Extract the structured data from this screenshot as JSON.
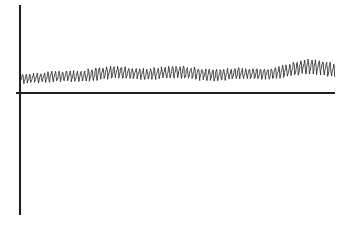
{
  "figure": {
    "background_color": "#ffffff",
    "axis_color": "#231f20",
    "signal_color": "#2b2b2f",
    "width": 352,
    "height": 225
  },
  "axes": {
    "y_axis": {
      "name": "y-axis",
      "x": 20,
      "y_top": 5,
      "y_bottom": 215
    },
    "x_axis": {
      "name": "x-axis",
      "y": 93,
      "x_left": 16,
      "x_right": 335
    }
  },
  "chart_data": {
    "type": "line",
    "title": "",
    "subtitle": "",
    "xlabel": "",
    "ylabel": "",
    "grid": false,
    "legend": null,
    "annotations": [],
    "xticks": [],
    "yticks": [],
    "xlim": [
      0,
      100
    ],
    "ylim": [
      -40,
      60
    ],
    "series": [
      {
        "name": "vibration-signal",
        "oscillation_count": 86,
        "samples_per_cycle": 9,
        "baseline_envelope": {
          "x": [
            0,
            8,
            16,
            24,
            32,
            40,
            48,
            56,
            64,
            72,
            80,
            88,
            94,
            100
          ],
          "y": [
            14,
            15,
            17,
            19,
            20,
            20,
            21,
            20,
            19,
            19,
            20,
            24,
            26,
            24
          ]
        },
        "amplitude_envelope": {
          "x": [
            0,
            8,
            16,
            24,
            32,
            40,
            48,
            56,
            64,
            72,
            80,
            88,
            94,
            100
          ],
          "y": [
            9,
            10,
            11,
            13,
            12,
            11,
            12,
            13,
            12,
            11,
            11,
            14,
            16,
            13
          ]
        },
        "wobble": {
          "x": [
            0,
            10,
            20,
            30,
            40,
            50,
            60,
            70,
            80,
            90,
            100
          ],
          "y": [
            0,
            1.2,
            -0.8,
            1.6,
            -1.0,
            0.9,
            -1.4,
            1.1,
            -0.6,
            1.8,
            -0.9
          ]
        }
      }
    ]
  }
}
